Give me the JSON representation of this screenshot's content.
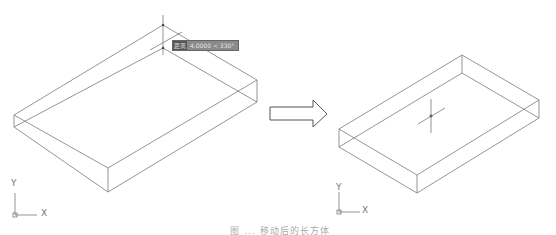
{
  "left_view": {
    "tooltip": {
      "tag": "距离",
      "value": "4.0000 < 330°"
    },
    "ucs": {
      "x_label": "X",
      "y_label": "Y"
    }
  },
  "arrow": {
    "direction": "right"
  },
  "right_view": {
    "ucs": {
      "x_label": "X",
      "y_label": "Y"
    }
  },
  "caption": "图 ... 移动后的长方体"
}
